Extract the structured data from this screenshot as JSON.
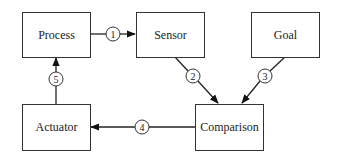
{
  "diagram": {
    "nodes": {
      "process": "Process",
      "sensor": "Sensor",
      "goal": "Goal",
      "actuator": "Actuator",
      "comparison": "Comparison"
    },
    "edges": [
      {
        "label": "1",
        "from": "Process",
        "to": "Sensor"
      },
      {
        "label": "2",
        "from": "Sensor",
        "to": "Comparison"
      },
      {
        "label": "3",
        "from": "Goal",
        "to": "Comparison"
      },
      {
        "label": "4",
        "from": "Comparison",
        "to": "Actuator"
      },
      {
        "label": "5",
        "from": "Actuator",
        "to": "Process"
      }
    ],
    "colors": {
      "stroke": "#333333",
      "text": "#222222",
      "background": "#ffffff"
    }
  }
}
